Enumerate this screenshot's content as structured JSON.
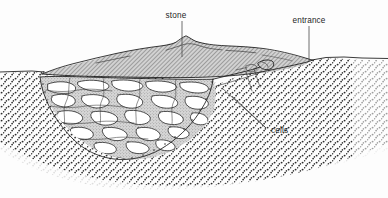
{
  "figure": {
    "kind": "cross-section line drawing",
    "width": 388,
    "height": 198,
    "background_color": "#fdfdfd",
    "ink_color": "#181818",
    "leader_color": "#4a4a4a"
  },
  "labels": [
    {
      "id": "stone",
      "text": "stone",
      "text_x": 176,
      "text_y": 18,
      "anchor": "middle",
      "leader": {
        "x1": 182,
        "y1": 21,
        "x2": 182,
        "y2": 57
      }
    },
    {
      "id": "entrance",
      "text": "entrance",
      "text_x": 309,
      "text_y": 23,
      "anchor": "middle",
      "leader": {
        "x1": 309,
        "y1": 26,
        "x2": 309,
        "y2": 61
      }
    },
    {
      "id": "cells",
      "text": "cells",
      "text_x": 271,
      "text_y": 133,
      "anchor": "start",
      "leader_target_x": 267,
      "leader_target_y": 128,
      "leaders": [
        {
          "x1": 266,
          "y1": 128,
          "x2": 222,
          "y2": 88
        },
        {
          "x1": 266,
          "y1": 128,
          "x2": 232,
          "y2": 95
        }
      ]
    }
  ],
  "regions": [
    {
      "id": "mound",
      "name": "stone-capped mound",
      "fill": "#b6b6b6",
      "pattern": "diagonal-hatch"
    },
    {
      "id": "cell-matrix",
      "name": "nest matrix with cells",
      "fill": "#c9c9c9",
      "pattern": "fine-stipple"
    },
    {
      "id": "cells",
      "name": "cell cavities",
      "fill": "#ffffff"
    },
    {
      "id": "soil",
      "name": "surrounding soil",
      "fill": "#fdfdfd",
      "pattern": "dot-stipple"
    }
  ],
  "colors": {
    "mound_fill": "#b6b6b6",
    "matrix_fill": "#c9c9c9",
    "cell_fill": "#ffffff",
    "soil_dot": "#2b2b2b",
    "ink": "#181818"
  }
}
